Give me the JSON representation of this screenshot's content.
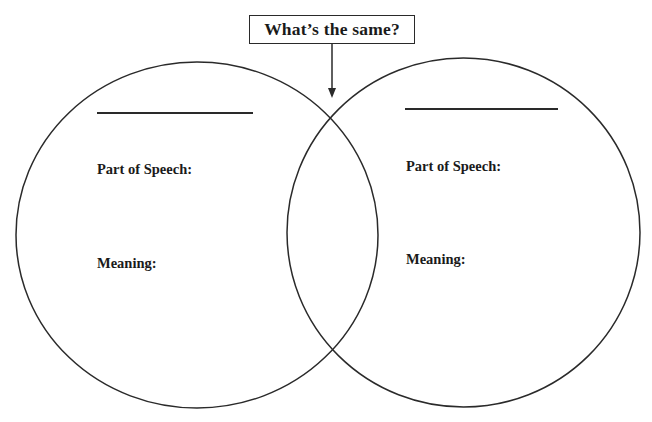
{
  "diagram": {
    "type": "venn",
    "title_box": {
      "text": "What’s the same?",
      "arrow": "points-down-to-overlap"
    },
    "circles": [
      {
        "id": "left",
        "word_blank": "",
        "part_of_speech_label": "Part of Speech:",
        "part_of_speech_value": "",
        "meaning_label": "Meaning:",
        "meaning_value": ""
      },
      {
        "id": "right",
        "word_blank": "",
        "part_of_speech_label": "Part of Speech:",
        "part_of_speech_value": "",
        "meaning_label": "Meaning:",
        "meaning_value": ""
      }
    ],
    "overlap": {
      "value": ""
    },
    "colors": {
      "stroke": "#2a2a2a",
      "text": "#1a1a1a",
      "background": "#ffffff"
    }
  }
}
